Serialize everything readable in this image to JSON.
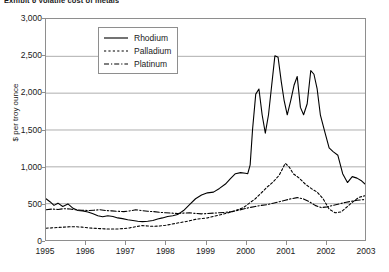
{
  "exhibit": {
    "title": "Exhibit 6  Volatile cost of metals"
  },
  "legend": {
    "items": [
      {
        "label": "Rhodium",
        "style": "solid"
      },
      {
        "label": "Palladium",
        "style": "dotted"
      },
      {
        "label": "Platinum",
        "style": "dash-dot"
      }
    ]
  },
  "chart_data": {
    "type": "line",
    "title": "Exhibit 6  Volatile cost of metals",
    "xlabel": "",
    "ylabel": "$ per troy ounce",
    "ylim": [
      0,
      3000
    ],
    "xlim": [
      1995,
      2003
    ],
    "grid": true,
    "legend_position": "upper-left-inside",
    "ytick_labels": [
      "3,000",
      "2,500",
      "2,000",
      "1,500",
      "1,000",
      "500",
      "0"
    ],
    "ytick_values": [
      3000,
      2500,
      2000,
      1500,
      1000,
      500,
      0
    ],
    "xtick_labels": [
      "1995",
      "1996",
      "1997",
      "1998",
      "1999",
      "2000",
      "2001",
      "2002",
      "2003"
    ],
    "xtick_values": [
      1995,
      1996,
      1997,
      1998,
      1999,
      2000,
      2001,
      2002,
      2003
    ],
    "units": "$ per troy ounce",
    "series": [
      {
        "name": "Rhodium",
        "style": "solid",
        "color": "#000000",
        "x": [
          1995.0,
          1995.1,
          1995.2,
          1995.3,
          1995.42,
          1995.55,
          1995.68,
          1995.8,
          1995.92,
          1996.05,
          1996.18,
          1996.3,
          1996.42,
          1996.55,
          1996.68,
          1996.8,
          1996.92,
          1997.05,
          1997.18,
          1997.3,
          1997.42,
          1997.55,
          1997.68,
          1997.8,
          1997.92,
          1998.05,
          1998.18,
          1998.3,
          1998.45,
          1998.6,
          1998.75,
          1998.9,
          1999.05,
          1999.2,
          1999.35,
          1999.5,
          1999.62,
          1999.75,
          1999.88,
          2000.0,
          2000.06,
          2000.12,
          2000.18,
          2000.26,
          2000.34,
          2000.42,
          2000.5,
          2000.58,
          2000.66,
          2000.74,
          2000.82,
          2000.9,
          2000.97,
          2001.05,
          2001.14,
          2001.22,
          2001.3,
          2001.38,
          2001.46,
          2001.55,
          2001.64,
          2001.72,
          2001.8,
          2001.88,
          2002.0,
          2002.1,
          2002.2,
          2002.32,
          2002.44,
          2002.56,
          2002.68,
          2002.8,
          2002.92,
          2003.0
        ],
        "y": [
          560,
          520,
          470,
          500,
          455,
          490,
          430,
          400,
          395,
          380,
          355,
          330,
          315,
          330,
          320,
          300,
          290,
          275,
          265,
          255,
          250,
          255,
          265,
          285,
          300,
          320,
          330,
          345,
          400,
          480,
          560,
          610,
          640,
          650,
          700,
          760,
          830,
          900,
          915,
          905,
          900,
          1020,
          1500,
          1980,
          2050,
          1700,
          1450,
          1700,
          2100,
          2500,
          2480,
          2150,
          1900,
          1700,
          1900,
          2100,
          2220,
          1800,
          1700,
          1850,
          2300,
          2250,
          2050,
          1700,
          1450,
          1250,
          1200,
          1150,
          900,
          780,
          860,
          840,
          800,
          760
        ],
        "y_units": "$ per troy ounce"
      },
      {
        "name": "Palladium",
        "style": "dotted",
        "color": "#000000",
        "x": [
          1995.0,
          1995.15,
          1995.3,
          1995.45,
          1995.6,
          1995.75,
          1995.9,
          1996.05,
          1996.2,
          1996.35,
          1996.5,
          1996.65,
          1996.8,
          1996.95,
          1997.1,
          1997.25,
          1997.4,
          1997.55,
          1997.7,
          1997.85,
          1998.0,
          1998.15,
          1998.3,
          1998.45,
          1998.6,
          1998.75,
          1998.9,
          1999.05,
          1999.2,
          1999.35,
          1999.5,
          1999.65,
          1999.8,
          1999.95,
          2000.1,
          2000.25,
          2000.4,
          2000.55,
          2000.7,
          2000.85,
          2001.0,
          2001.1,
          2001.2,
          2001.35,
          2001.5,
          2001.65,
          2001.8,
          2001.95,
          2002.1,
          2002.25,
          2002.4,
          2002.55,
          2002.7,
          2002.85,
          2003.0
        ],
        "y": [
          160,
          165,
          170,
          175,
          180,
          180,
          175,
          165,
          160,
          155,
          150,
          150,
          150,
          155,
          165,
          180,
          195,
          190,
          185,
          190,
          200,
          215,
          230,
          245,
          260,
          280,
          290,
          300,
          320,
          340,
          360,
          380,
          410,
          440,
          500,
          560,
          640,
          720,
          790,
          880,
          1040,
          990,
          900,
          840,
          760,
          700,
          650,
          560,
          420,
          370,
          380,
          450,
          520,
          580,
          600
        ],
        "y_units": "$ per troy ounce"
      },
      {
        "name": "Platinum",
        "style": "dash-dot",
        "color": "#000000",
        "x": [
          1995.0,
          1995.15,
          1995.3,
          1995.45,
          1995.6,
          1995.75,
          1995.9,
          1996.05,
          1996.2,
          1996.35,
          1996.5,
          1996.65,
          1996.8,
          1996.95,
          1997.1,
          1997.25,
          1997.4,
          1997.55,
          1997.7,
          1997.85,
          1998.0,
          1998.15,
          1998.3,
          1998.45,
          1998.6,
          1998.75,
          1998.9,
          1999.05,
          1999.2,
          1999.35,
          1999.5,
          1999.65,
          1999.8,
          1999.95,
          2000.1,
          2000.25,
          2000.4,
          2000.55,
          2000.7,
          2000.85,
          2001.0,
          2001.15,
          2001.3,
          2001.45,
          2001.6,
          2001.75,
          2001.9,
          2002.05,
          2002.2,
          2002.35,
          2002.5,
          2002.65,
          2002.8,
          2003.0
        ],
        "y": [
          410,
          420,
          415,
          425,
          420,
          410,
          405,
          400,
          405,
          410,
          400,
          395,
          390,
          385,
          395,
          410,
          400,
          390,
          385,
          375,
          370,
          365,
          360,
          365,
          370,
          360,
          355,
          360,
          365,
          370,
          375,
          385,
          400,
          420,
          440,
          455,
          470,
          480,
          500,
          520,
          540,
          560,
          575,
          560,
          520,
          470,
          440,
          450,
          470,
          490,
          510,
          525,
          540,
          550
        ],
        "y_units": "$ per troy ounce"
      }
    ]
  }
}
